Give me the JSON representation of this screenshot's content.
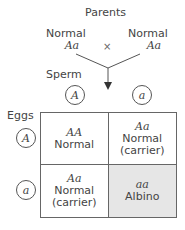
{
  "title": "Parents",
  "cross_symbol": "×",
  "parents": [
    {
      "phenotype": "Normal",
      "genotype": "Aa"
    },
    {
      "phenotype": "Normal",
      "genotype": "Aa"
    }
  ],
  "sperm_label": "Sperm",
  "eggs_label": "Eggs",
  "sperm_alleles": [
    "A",
    "a"
  ],
  "egg_alleles": [
    "A",
    "a"
  ],
  "cells": [
    {
      "genotype": "AA",
      "phenotype": "Normal",
      "note": ""
    },
    {
      "genotype": "Aa",
      "phenotype": "Normal",
      "note": "(carrier)"
    },
    {
      "genotype": "Aa",
      "phenotype": "Normal",
      "note": "(carrier)"
    },
    {
      "genotype": "aa",
      "phenotype": "Albino",
      "note": ""
    }
  ],
  "colors": {
    "shaded_cell": "#e6e6e6",
    "lines": "#555555"
  }
}
